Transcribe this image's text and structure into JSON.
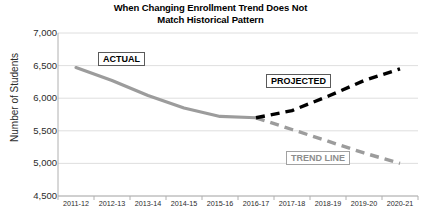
{
  "chart_data": {
    "type": "line",
    "title": "When Changing Enrollment Trend Does Not Match Historical Pattern",
    "title_line1": "When Changing Enrollment Trend Does Not",
    "title_line2": "Match Historical Pattern",
    "xlabel": "",
    "ylabel": "Number of Students",
    "ylim": [
      4500,
      7000
    ],
    "yticks": [
      7000,
      6500,
      6000,
      5500,
      5000,
      4500
    ],
    "ytick_labels": [
      "7,000",
      "6,500",
      "6,000",
      "5,500",
      "5,000",
      "4,500"
    ],
    "grid": true,
    "legend_position": "inline-annotations",
    "categories": [
      "2011-12",
      "2012-13",
      "2013-14",
      "2014-15",
      "2015-16",
      "2016-17",
      "2017-18",
      "2018-19",
      "2019-20",
      "2020-21"
    ],
    "series": [
      {
        "name": "ACTUAL",
        "style": "solid",
        "color": "#9c9c9c",
        "x": [
          "2011-12",
          "2012-13",
          "2013-14",
          "2014-15",
          "2015-16",
          "2016-17"
        ],
        "values": [
          6470,
          6270,
          6040,
          5850,
          5720,
          5700
        ]
      },
      {
        "name": "TREND LINE",
        "style": "dashed",
        "color": "#9c9c9c",
        "x": [
          "2016-17",
          "2017-18",
          "2018-19",
          "2019-20",
          "2020-21"
        ],
        "values": [
          5700,
          5520,
          5340,
          5160,
          5000
        ]
      },
      {
        "name": "PROJECTED",
        "style": "dashed",
        "color": "#000000",
        "x": [
          "2016-17",
          "2017-18",
          "2018-19",
          "2019-20",
          "2020-21"
        ],
        "values": [
          5700,
          5810,
          6030,
          6270,
          6450
        ]
      }
    ],
    "annotations": [
      {
        "text": "ACTUAL",
        "series": "ACTUAL",
        "color": "#8d8d8d"
      },
      {
        "text": "PROJECTED",
        "series": "PROJECTED",
        "color": "#000000"
      },
      {
        "text": "TREND LINE",
        "series": "TREND LINE",
        "color": "#8d8d8d"
      }
    ]
  }
}
